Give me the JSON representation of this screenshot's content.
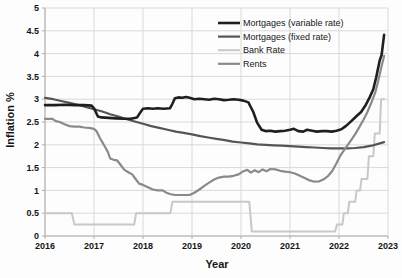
{
  "meta": {
    "background_color": "#fdfdfd",
    "grid_color": "#d9d9d9",
    "axis_color": "#aeaeae",
    "tick_text_color": "#161616",
    "legend_text_color": "#161616"
  },
  "chart_data": {
    "type": "line",
    "title": "",
    "xlabel": "Year",
    "ylabel": "Inflation %",
    "x_range": [
      2016,
      2023
    ],
    "x_tick_step": 1,
    "x_tick_labels": [
      "2016",
      "2017",
      "2018",
      "2019",
      "2020",
      "2021",
      "2022",
      "2023"
    ],
    "y_range": [
      0,
      5
    ],
    "y_tick_step": 0.5,
    "y_tick_labels": [
      "0",
      "0.5",
      "1",
      "1.5",
      "2",
      "2.5",
      "3",
      "3.5",
      "4",
      "4.5",
      "5"
    ],
    "grid": true,
    "legend_position": "top-right-inside",
    "series": [
      {
        "name": "Mortgages (variable rate)",
        "color": "#1f1f1f",
        "stroke_width": 2.6,
        "points": [
          [
            2016.0,
            2.87
          ],
          [
            2016.2,
            2.87
          ],
          [
            2016.4,
            2.88
          ],
          [
            2016.6,
            2.87
          ],
          [
            2016.8,
            2.87
          ],
          [
            2016.95,
            2.86
          ],
          [
            2017.0,
            2.8
          ],
          [
            2017.08,
            2.62
          ],
          [
            2017.15,
            2.6
          ],
          [
            2017.3,
            2.59
          ],
          [
            2017.45,
            2.58
          ],
          [
            2017.6,
            2.57
          ],
          [
            2017.75,
            2.57
          ],
          [
            2017.88,
            2.6
          ],
          [
            2017.95,
            2.72
          ],
          [
            2018.0,
            2.79
          ],
          [
            2018.1,
            2.8
          ],
          [
            2018.2,
            2.79
          ],
          [
            2018.3,
            2.8
          ],
          [
            2018.42,
            2.79
          ],
          [
            2018.55,
            2.8
          ],
          [
            2018.6,
            2.9
          ],
          [
            2018.65,
            3.02
          ],
          [
            2018.72,
            3.04
          ],
          [
            2018.8,
            3.03
          ],
          [
            2018.88,
            3.05
          ],
          [
            2018.95,
            3.03
          ],
          [
            2019.05,
            3.0
          ],
          [
            2019.15,
            3.01
          ],
          [
            2019.25,
            3.0
          ],
          [
            2019.35,
            2.99
          ],
          [
            2019.45,
            3.01
          ],
          [
            2019.55,
            3.0
          ],
          [
            2019.65,
            2.98
          ],
          [
            2019.75,
            2.99
          ],
          [
            2019.85,
            3.0
          ],
          [
            2019.95,
            2.99
          ],
          [
            2020.05,
            2.97
          ],
          [
            2020.15,
            2.93
          ],
          [
            2020.25,
            2.72
          ],
          [
            2020.33,
            2.48
          ],
          [
            2020.42,
            2.33
          ],
          [
            2020.5,
            2.3
          ],
          [
            2020.6,
            2.31
          ],
          [
            2020.7,
            2.29
          ],
          [
            2020.8,
            2.3
          ],
          [
            2020.9,
            2.31
          ],
          [
            2021.0,
            2.33
          ],
          [
            2021.08,
            2.35
          ],
          [
            2021.17,
            2.3
          ],
          [
            2021.27,
            2.29
          ],
          [
            2021.35,
            2.33
          ],
          [
            2021.45,
            2.31
          ],
          [
            2021.55,
            2.29
          ],
          [
            2021.65,
            2.3
          ],
          [
            2021.75,
            2.3
          ],
          [
            2021.85,
            2.29
          ],
          [
            2021.95,
            2.31
          ],
          [
            2022.05,
            2.34
          ],
          [
            2022.15,
            2.42
          ],
          [
            2022.25,
            2.52
          ],
          [
            2022.35,
            2.62
          ],
          [
            2022.45,
            2.72
          ],
          [
            2022.55,
            2.88
          ],
          [
            2022.63,
            3.05
          ],
          [
            2022.7,
            3.22
          ],
          [
            2022.76,
            3.48
          ],
          [
            2022.83,
            3.85
          ],
          [
            2022.87,
            3.97
          ],
          [
            2022.92,
            4.41
          ]
        ]
      },
      {
        "name": "Mortgages (fixed rate)",
        "color": "#555555",
        "stroke_width": 2.2,
        "points": [
          [
            2016.0,
            3.03
          ],
          [
            2016.17,
            3.0
          ],
          [
            2016.33,
            2.96
          ],
          [
            2016.5,
            2.92
          ],
          [
            2016.67,
            2.88
          ],
          [
            2016.83,
            2.83
          ],
          [
            2017.0,
            2.78
          ],
          [
            2017.17,
            2.73
          ],
          [
            2017.33,
            2.67
          ],
          [
            2017.5,
            2.62
          ],
          [
            2017.67,
            2.56
          ],
          [
            2017.83,
            2.51
          ],
          [
            2018.0,
            2.46
          ],
          [
            2018.17,
            2.41
          ],
          [
            2018.33,
            2.37
          ],
          [
            2018.5,
            2.33
          ],
          [
            2018.67,
            2.29
          ],
          [
            2018.83,
            2.26
          ],
          [
            2019.0,
            2.23
          ],
          [
            2019.17,
            2.19
          ],
          [
            2019.33,
            2.16
          ],
          [
            2019.5,
            2.13
          ],
          [
            2019.67,
            2.1
          ],
          [
            2019.83,
            2.07
          ],
          [
            2020.0,
            2.05
          ],
          [
            2020.17,
            2.03
          ],
          [
            2020.33,
            2.01
          ],
          [
            2020.5,
            2.0
          ],
          [
            2020.67,
            1.99
          ],
          [
            2020.83,
            1.98
          ],
          [
            2021.0,
            1.97
          ],
          [
            2021.17,
            1.96
          ],
          [
            2021.33,
            1.95
          ],
          [
            2021.5,
            1.94
          ],
          [
            2021.67,
            1.93
          ],
          [
            2021.83,
            1.92
          ],
          [
            2022.0,
            1.92
          ],
          [
            2022.17,
            1.92
          ],
          [
            2022.33,
            1.93
          ],
          [
            2022.5,
            1.95
          ],
          [
            2022.67,
            1.98
          ],
          [
            2022.83,
            2.03
          ],
          [
            2022.92,
            2.06
          ]
        ]
      },
      {
        "name": "Bank Rate",
        "color": "#c8c8c8",
        "stroke_width": 2.0,
        "points": [
          [
            2016.0,
            0.5
          ],
          [
            2016.55,
            0.5
          ],
          [
            2016.6,
            0.25
          ],
          [
            2017.82,
            0.25
          ],
          [
            2017.86,
            0.5
          ],
          [
            2018.56,
            0.5
          ],
          [
            2018.6,
            0.75
          ],
          [
            2020.17,
            0.75
          ],
          [
            2020.22,
            0.1
          ],
          [
            2021.92,
            0.1
          ],
          [
            2021.96,
            0.25
          ],
          [
            2022.07,
            0.25
          ],
          [
            2022.1,
            0.5
          ],
          [
            2022.18,
            0.5
          ],
          [
            2022.21,
            0.75
          ],
          [
            2022.33,
            0.75
          ],
          [
            2022.36,
            1.0
          ],
          [
            2022.43,
            1.0
          ],
          [
            2022.46,
            1.25
          ],
          [
            2022.58,
            1.25
          ],
          [
            2022.61,
            1.75
          ],
          [
            2022.7,
            1.75
          ],
          [
            2022.73,
            2.25
          ],
          [
            2022.83,
            2.25
          ],
          [
            2022.86,
            3.0
          ],
          [
            2022.92,
            3.0
          ]
        ]
      },
      {
        "name": "Rents",
        "color": "#8a8a8a",
        "stroke_width": 2.2,
        "points": [
          [
            2016.0,
            2.57
          ],
          [
            2016.15,
            2.57
          ],
          [
            2016.22,
            2.52
          ],
          [
            2016.3,
            2.5
          ],
          [
            2016.4,
            2.45
          ],
          [
            2016.5,
            2.41
          ],
          [
            2016.6,
            2.4
          ],
          [
            2016.7,
            2.4
          ],
          [
            2016.8,
            2.38
          ],
          [
            2016.9,
            2.37
          ],
          [
            2017.0,
            2.35
          ],
          [
            2017.05,
            2.3
          ],
          [
            2017.12,
            2.15
          ],
          [
            2017.2,
            2.0
          ],
          [
            2017.28,
            1.85
          ],
          [
            2017.33,
            1.7
          ],
          [
            2017.4,
            1.67
          ],
          [
            2017.47,
            1.66
          ],
          [
            2017.55,
            1.55
          ],
          [
            2017.62,
            1.45
          ],
          [
            2017.7,
            1.4
          ],
          [
            2017.78,
            1.35
          ],
          [
            2017.85,
            1.25
          ],
          [
            2017.92,
            1.15
          ],
          [
            2018.0,
            1.12
          ],
          [
            2018.1,
            1.07
          ],
          [
            2018.2,
            1.02
          ],
          [
            2018.3,
            1.0
          ],
          [
            2018.4,
            1.0
          ],
          [
            2018.48,
            0.95
          ],
          [
            2018.55,
            0.92
          ],
          [
            2018.65,
            0.9
          ],
          [
            2018.8,
            0.9
          ],
          [
            2018.95,
            0.9
          ],
          [
            2019.05,
            0.95
          ],
          [
            2019.15,
            1.02
          ],
          [
            2019.25,
            1.1
          ],
          [
            2019.35,
            1.17
          ],
          [
            2019.45,
            1.24
          ],
          [
            2019.55,
            1.28
          ],
          [
            2019.65,
            1.3
          ],
          [
            2019.75,
            1.3
          ],
          [
            2019.85,
            1.32
          ],
          [
            2019.95,
            1.35
          ],
          [
            2020.05,
            1.42
          ],
          [
            2020.13,
            1.45
          ],
          [
            2020.2,
            1.39
          ],
          [
            2020.28,
            1.44
          ],
          [
            2020.36,
            1.4
          ],
          [
            2020.44,
            1.46
          ],
          [
            2020.52,
            1.42
          ],
          [
            2020.6,
            1.47
          ],
          [
            2020.7,
            1.46
          ],
          [
            2020.8,
            1.43
          ],
          [
            2020.9,
            1.41
          ],
          [
            2021.0,
            1.4
          ],
          [
            2021.1,
            1.37
          ],
          [
            2021.2,
            1.32
          ],
          [
            2021.3,
            1.27
          ],
          [
            2021.4,
            1.22
          ],
          [
            2021.5,
            1.19
          ],
          [
            2021.6,
            1.2
          ],
          [
            2021.7,
            1.25
          ],
          [
            2021.78,
            1.32
          ],
          [
            2021.86,
            1.42
          ],
          [
            2021.94,
            1.58
          ],
          [
            2022.02,
            1.75
          ],
          [
            2022.1,
            1.88
          ],
          [
            2022.18,
            2.0
          ],
          [
            2022.26,
            2.12
          ],
          [
            2022.34,
            2.25
          ],
          [
            2022.42,
            2.4
          ],
          [
            2022.5,
            2.55
          ],
          [
            2022.58,
            2.72
          ],
          [
            2022.66,
            2.92
          ],
          [
            2022.74,
            3.15
          ],
          [
            2022.8,
            3.4
          ],
          [
            2022.86,
            3.68
          ],
          [
            2022.92,
            3.95
          ]
        ]
      }
    ]
  }
}
